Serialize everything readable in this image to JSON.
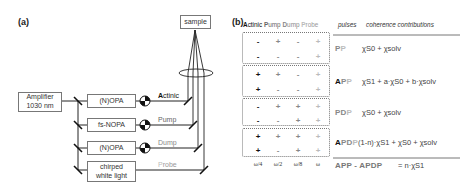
{
  "panel_a": {
    "label": "(a)",
    "amplifier": {
      "line1": "Amplifier",
      "line2": "1030 nm"
    },
    "sample": "sample",
    "boxes": [
      "(N)OPA",
      "fs-NOPA",
      "(N)OPA",
      "chirped white light"
    ],
    "chirped_line1": "chirped",
    "chirped_line2": "white light",
    "beams": [
      {
        "first": "A",
        "rest": "ctinic",
        "color": "#111111"
      },
      {
        "first": "P",
        "rest": "ump",
        "color": "#666666"
      },
      {
        "first": "D",
        "rest": "ump",
        "color": "#888888"
      },
      {
        "first": "P",
        "rest": "robe",
        "color": "#bbbbbb"
      }
    ]
  },
  "panel_b": {
    "label": "(b)",
    "header": {
      "beams": [
        {
          "first": "A",
          "rest": "ctinic",
          "color": "#111111"
        },
        {
          "first": "P",
          "rest": "ump",
          "color": "#666666"
        },
        {
          "first": "D",
          "rest": "ump",
          "color": "#888888"
        },
        {
          "first": "P",
          "rest": "robe",
          "color": "#bbbbbb"
        }
      ],
      "pulses": "pulses",
      "coherence": "coherence contributions"
    },
    "sign_colors": [
      "#111111",
      "#666666",
      "#888888",
      "#bbbbbb"
    ],
    "groups": [
      {
        "rows": [
          [
            "-",
            "+",
            "-",
            "+"
          ],
          [
            "-",
            "-",
            "-",
            "+"
          ]
        ],
        "pulse": [
          {
            "t": "P",
            "c": "#888888"
          },
          {
            "t": "P",
            "c": "#bbbbbb"
          }
        ],
        "coherence": "χS0 + χsolv"
      },
      {
        "rows": [
          [
            "+",
            "+",
            "-",
            "+"
          ],
          [
            "+",
            "-",
            "-",
            "+"
          ]
        ],
        "pulse": [
          {
            "t": "A",
            "c": "#111111"
          },
          {
            "t": "P",
            "c": "#888888"
          },
          {
            "t": "P",
            "c": "#bbbbbb"
          }
        ],
        "coherence": "χS1 + a·χS0 + b·χsolv"
      },
      {
        "rows": [
          [
            "-",
            "+",
            "+",
            "+"
          ],
          [
            "-",
            "-",
            "+",
            "+"
          ]
        ],
        "pulse": [
          {
            "t": "P",
            "c": "#888888"
          },
          {
            "t": "D",
            "c": "#888888"
          },
          {
            "t": "P",
            "c": "#bbbbbb"
          }
        ],
        "coherence": "χS0 + χsolv"
      },
      {
        "rows": [
          [
            "+",
            "+",
            "+",
            "+"
          ],
          [
            "+",
            "-",
            "+",
            "+"
          ]
        ],
        "pulse": [
          {
            "t": "A",
            "c": "#111111"
          },
          {
            "t": "P",
            "c": "#888888"
          },
          {
            "t": "D",
            "c": "#888888"
          },
          {
            "t": "P",
            "c": "#bbbbbb"
          }
        ],
        "coherence": "(1-n)·χS1 + χS0 + χsolv"
      }
    ],
    "frequencies": [
      "ω/4",
      "ω/2",
      "ω/8",
      "ω"
    ],
    "result": {
      "left": "APP - APDP",
      "right": "= n·χS1"
    }
  }
}
